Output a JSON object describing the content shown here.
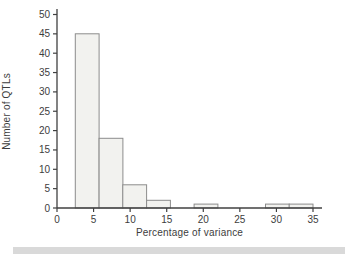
{
  "chart_data": {
    "type": "bar",
    "subtype": "histogram",
    "title": "",
    "xlabel": "Percentage of variance",
    "ylabel": "Number of QTLs",
    "bin_edges": [
      2.5,
      5.75,
      9.0,
      12.25,
      15.5,
      18.75,
      22.0,
      25.25,
      28.5,
      31.75,
      35.0
    ],
    "counts": [
      45,
      18,
      6,
      2,
      0,
      1,
      0,
      0,
      1,
      1
    ],
    "x_ticks": [
      0,
      5,
      10,
      15,
      20,
      25,
      30,
      35
    ],
    "y_ticks": [
      0,
      5,
      10,
      15,
      20,
      25,
      30,
      35,
      40,
      45,
      50
    ],
    "xlim": [
      0,
      36.2
    ],
    "ylim": [
      0,
      51
    ],
    "grid": false,
    "legend": null,
    "colors": {
      "bar_fill": "#f2f2ef",
      "bar_stroke": "#8c8c8c",
      "axis": "#404040",
      "text": "#3d3d3d",
      "background": "#ffffff",
      "bottom_strip": "#d9d9d9"
    }
  }
}
